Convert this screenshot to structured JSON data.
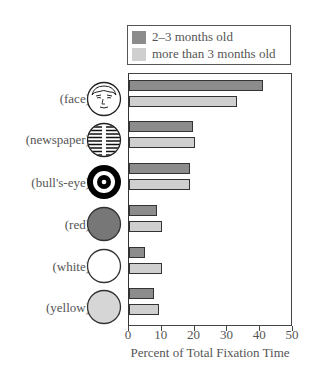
{
  "chart_data": {
    "type": "bar",
    "orientation": "horizontal",
    "title": "",
    "categories": [
      "(face)",
      "(newspaper)",
      "(bull's-eye)",
      "(red)",
      "(white)",
      "(yellow)"
    ],
    "series": [
      {
        "name": "2–3 months old",
        "color": "#8c8c8c",
        "values": [
          41,
          19.5,
          18.5,
          8.5,
          5,
          7.5
        ]
      },
      {
        "name": "more than 3 months old",
        "color": "#cfcfcf",
        "values": [
          33,
          20,
          18.5,
          10,
          10,
          9
        ]
      }
    ],
    "xlabel": "Percent of Total Fixation Time",
    "ylabel": "",
    "xlim": [
      0,
      50
    ],
    "xticks": [
      "0",
      "10",
      "20",
      "30",
      "40",
      "50"
    ],
    "grid": false,
    "legend_position": "top"
  },
  "stimuli_icons": [
    "face-icon",
    "newspaper-icon",
    "bullseye-icon",
    "red-disc-icon",
    "white-disc-icon",
    "yellow-disc-icon"
  ]
}
